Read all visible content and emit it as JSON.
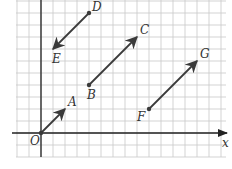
{
  "diagram": {
    "type": "vector-grid",
    "grid": {
      "unit_px": 12,
      "origin_px": [
        41,
        133
      ],
      "x_min": -2,
      "x_max": 15,
      "y_min": -2,
      "y_max": 11,
      "color": "#c8c8c8"
    },
    "axes": {
      "x_label": "x",
      "origin_label": "O",
      "color": "#222222"
    },
    "points": [
      {
        "id": "O",
        "label": "O",
        "x": 0,
        "y": 0
      },
      {
        "id": "A",
        "label": "A",
        "x": 2,
        "y": 2
      },
      {
        "id": "B",
        "label": "B",
        "x": 4,
        "y": 4
      },
      {
        "id": "C",
        "label": "C",
        "x": 8,
        "y": 8
      },
      {
        "id": "D",
        "label": "D",
        "x": 4,
        "y": 10
      },
      {
        "id": "E",
        "label": "E",
        "x": 1,
        "y": 7
      },
      {
        "id": "F",
        "label": "F",
        "x": 9,
        "y": 2
      },
      {
        "id": "G",
        "label": "G",
        "x": 13,
        "y": 6
      }
    ],
    "vectors": [
      {
        "name": "OA",
        "from": "O",
        "to": "A"
      },
      {
        "name": "BC",
        "from": "B",
        "to": "C"
      },
      {
        "name": "DE",
        "from": "D",
        "to": "E"
      },
      {
        "name": "FG",
        "from": "F",
        "to": "G"
      }
    ],
    "vector_color": "#3a3a3a"
  }
}
